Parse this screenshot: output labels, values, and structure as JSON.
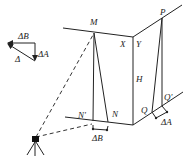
{
  "diagram": {
    "type": "geometric-surveying-figure",
    "legend_triangle": {
      "delta_b_label": "ΔB",
      "delta_a_label": "ΔA",
      "delta_label": "Δ"
    },
    "points": {
      "M": "M",
      "N": "N",
      "N_prime": "N'",
      "P": "P",
      "Q": "Q",
      "Q_prime": "Q'",
      "X": "X",
      "Y": "Y",
      "H": "H"
    },
    "offsets": {
      "delta_b": "ΔB",
      "delta_a": "ΔA"
    },
    "colors": {
      "line": "#222222",
      "background": "#ffffff"
    }
  }
}
